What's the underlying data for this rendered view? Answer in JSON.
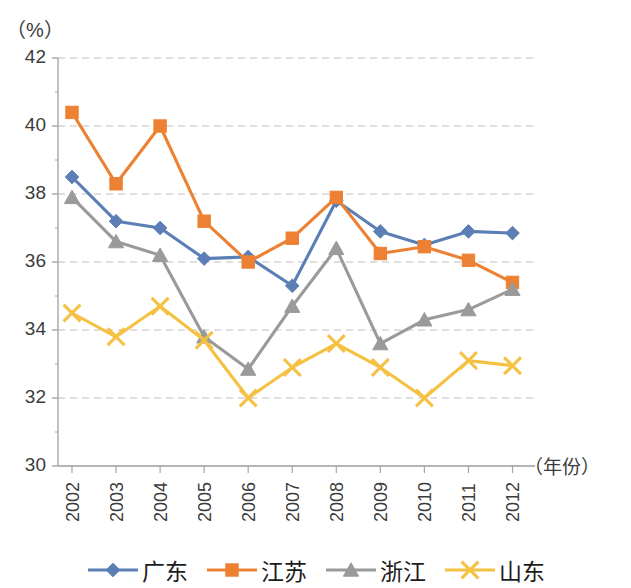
{
  "chart_data": {
    "type": "line",
    "title": "",
    "subtitle": "",
    "xlabel": "（年份）",
    "ylabel": "（%）",
    "ylim": [
      30,
      42
    ],
    "ytick_step": 2,
    "yticks": [
      30,
      32,
      34,
      36,
      38,
      40,
      42
    ],
    "grid": true,
    "grid_style": "dashed-horizontal",
    "legend_position": "bottom",
    "categories": [
      "2002",
      "2003",
      "2004",
      "2005",
      "2006",
      "2007",
      "2008",
      "2009",
      "2010",
      "2011",
      "2012"
    ],
    "x": [
      2002,
      2003,
      2004,
      2005,
      2006,
      2007,
      2008,
      2009,
      2010,
      2011,
      2012
    ],
    "series": [
      {
        "name": "广东",
        "color": "#5b7fb5",
        "marker": "diamond",
        "values": [
          38.5,
          37.2,
          37.0,
          36.1,
          36.15,
          35.3,
          37.8,
          36.9,
          36.5,
          36.9,
          36.85
        ]
      },
      {
        "name": "江苏",
        "color": "#ed8133",
        "marker": "square",
        "values": [
          40.4,
          38.3,
          40.0,
          37.2,
          36.0,
          36.7,
          37.9,
          36.25,
          36.45,
          36.05,
          35.4
        ]
      },
      {
        "name": "浙江",
        "color": "#9a9a9a",
        "marker": "triangle",
        "values": [
          37.9,
          36.6,
          36.2,
          33.8,
          32.85,
          34.7,
          36.4,
          33.6,
          34.3,
          34.6,
          35.2
        ]
      },
      {
        "name": "山东",
        "color": "#f5c142",
        "marker": "cross",
        "values": [
          34.5,
          33.8,
          34.7,
          33.7,
          32.0,
          32.9,
          33.6,
          32.9,
          32.0,
          33.1,
          32.95
        ]
      }
    ]
  },
  "axis": {
    "y_unit": "（%）",
    "x_title": "（年份）"
  },
  "colors": {
    "guangdong": "#5b7fb5",
    "jiangsu": "#ed8133",
    "zhejiang": "#9a9a9a",
    "shandong": "#f5c142",
    "axis": "#a6a6a6",
    "grid": "#bfbfbf",
    "text": "#3c3c3c"
  },
  "legend": {
    "items": [
      {
        "label": "广东",
        "color": "#5b7fb5",
        "marker": "diamond"
      },
      {
        "label": "江苏",
        "color": "#ed8133",
        "marker": "square"
      },
      {
        "label": "浙江",
        "color": "#9a9a9a",
        "marker": "triangle"
      },
      {
        "label": "山东",
        "color": "#f5c142",
        "marker": "cross"
      }
    ]
  }
}
